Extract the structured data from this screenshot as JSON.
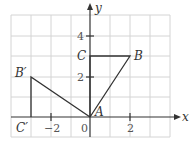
{
  "diagram": {
    "axes": {
      "x_label": "x",
      "y_label": "y",
      "x_ticks": [
        {
          "value": -2,
          "label": "−2"
        },
        {
          "value": 0,
          "label": "0"
        },
        {
          "value": 2,
          "label": "2"
        }
      ],
      "y_ticks": [
        {
          "value": 2,
          "label": "2"
        },
        {
          "value": 4,
          "label": "4"
        }
      ],
      "origin_label": "0",
      "x_range": [
        -4,
        4
      ],
      "y_range": [
        -1,
        5
      ]
    },
    "points": {
      "A": {
        "label": "A",
        "x": 0,
        "y": 0
      },
      "B": {
        "label": "B",
        "x": 2,
        "y": 3
      },
      "C": {
        "label": "C",
        "x": 0,
        "y": 3
      },
      "B_prime": {
        "label": "B′",
        "x": -3,
        "y": 2
      },
      "C_prime": {
        "label": "C′",
        "x": -3,
        "y": 0
      }
    },
    "shapes": [
      {
        "name": "triangle ABC",
        "vertices": [
          "A",
          "B",
          "C"
        ]
      },
      {
        "name": "triangle AB'C'",
        "vertices": [
          "A",
          "B'",
          "C'"
        ]
      }
    ],
    "colors": {
      "grid": "#d4d4d4",
      "lines": "#333333"
    }
  }
}
